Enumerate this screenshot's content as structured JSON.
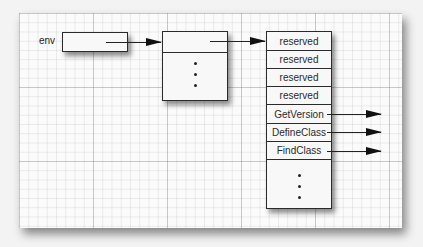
{
  "diagram": {
    "env_label": "env",
    "middle_box": {
      "dots": [
        "•",
        "•",
        "•"
      ]
    },
    "function_table": {
      "rows": [
        {
          "label": "reserved",
          "has_arrow": false
        },
        {
          "label": "reserved",
          "has_arrow": false
        },
        {
          "label": "reserved",
          "has_arrow": false
        },
        {
          "label": "reserved",
          "has_arrow": false
        },
        {
          "label": "GetVersion",
          "has_arrow": true
        },
        {
          "label": "DefineClass",
          "has_arrow": true
        },
        {
          "label": "FindClass",
          "has_arrow": true
        }
      ],
      "trailing_dots": [
        "•",
        "•",
        "•"
      ]
    },
    "colors": {
      "line": "#222222",
      "paper": "#fbfbfb",
      "grid": "#cfcfcf"
    }
  }
}
